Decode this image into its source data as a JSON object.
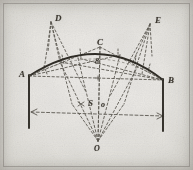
{
  "figure": {
    "medium": "aged printed plate, dashed construction lines",
    "ink_color": "#3a362f",
    "paper_color": "#e9e7e2",
    "labels": [
      {
        "id": "label-D",
        "text": "D",
        "x": 55,
        "y": 14
      },
      {
        "id": "label-E",
        "text": "E",
        "x": 155,
        "y": 16
      },
      {
        "id": "label-C",
        "text": "C",
        "x": 97,
        "y": 38
      },
      {
        "id": "label-8",
        "text": "8",
        "x": 95,
        "y": 58
      },
      {
        "id": "label-A",
        "text": "A",
        "x": 19,
        "y": 70
      },
      {
        "id": "label-B",
        "text": "B",
        "x": 168,
        "y": 76
      },
      {
        "id": "label-S",
        "text": "S",
        "x": 88,
        "y": 99
      },
      {
        "id": "label-o",
        "text": "o",
        "x": 101,
        "y": 101
      },
      {
        "id": "label-O",
        "text": "O",
        "x": 94,
        "y": 145
      }
    ],
    "points": {
      "A": {
        "x": 29,
        "y": 76
      },
      "B": {
        "x": 163,
        "y": 80
      },
      "C": {
        "x": 100,
        "y": 47
      },
      "D": {
        "x": 51,
        "y": 22
      },
      "E": {
        "x": 150,
        "y": 24
      },
      "O": {
        "x": 98,
        "y": 141
      },
      "S": {
        "x": 80,
        "y": 104
      },
      "center": {
        "x": 98,
        "y": 78
      },
      "eight": {
        "x": 100,
        "y": 66
      },
      "springing_left": {
        "x": 29,
        "y": 127
      },
      "springing_right": {
        "x": 163,
        "y": 130
      }
    },
    "arc": {
      "type": "segmental",
      "start": {
        "x": 29,
        "y": 76
      },
      "apex": {
        "x": 100,
        "y": 47
      },
      "end": {
        "x": 163,
        "y": 80
      }
    }
  }
}
